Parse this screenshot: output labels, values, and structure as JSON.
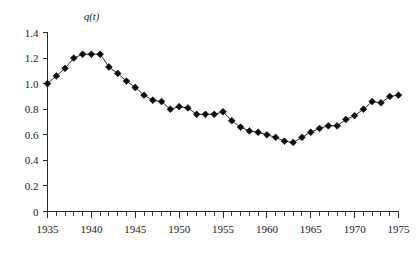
{
  "chart_data": {
    "type": "line",
    "title": "",
    "subtitle": "",
    "ylabel": "q(t)",
    "xlabel": "",
    "x": [
      1935,
      1936,
      1937,
      1938,
      1939,
      1940,
      1941,
      1942,
      1943,
      1944,
      1945,
      1946,
      1947,
      1948,
      1949,
      1950,
      1951,
      1952,
      1953,
      1954,
      1955,
      1956,
      1957,
      1958,
      1959,
      1960,
      1961,
      1962,
      1963,
      1964,
      1965,
      1966,
      1967,
      1968,
      1969,
      1970,
      1971,
      1972,
      1973,
      1974,
      1975
    ],
    "values": [
      1.0,
      1.06,
      1.12,
      1.2,
      1.23,
      1.23,
      1.23,
      1.13,
      1.08,
      1.02,
      0.97,
      0.91,
      0.87,
      0.86,
      0.8,
      0.82,
      0.81,
      0.76,
      0.76,
      0.76,
      0.78,
      0.71,
      0.66,
      0.63,
      0.62,
      0.6,
      0.58,
      0.55,
      0.54,
      0.58,
      0.62,
      0.65,
      0.67,
      0.67,
      0.72,
      0.75,
      0.8,
      0.86,
      0.85,
      0.9,
      0.91
    ],
    "series": [
      {
        "name": "q(t)",
        "marker": "diamond",
        "color": "#0d0d0d"
      }
    ],
    "xlim": [
      1935,
      1975
    ],
    "ylim": [
      0,
      1.4
    ],
    "x_major_ticks": [
      1935,
      1940,
      1945,
      1950,
      1955,
      1960,
      1965,
      1970,
      1975
    ],
    "x_major_tick_labels": [
      "1935",
      "1940",
      "1945",
      "1950",
      "1955",
      "1960",
      "1965",
      "1970",
      "1975"
    ],
    "x_minor_tick_step": 1,
    "y_major_ticks": [
      0,
      0.2,
      0.4,
      0.6,
      0.8,
      1.0,
      1.2,
      1.4
    ],
    "y_major_tick_labels": [
      "0",
      "0.2",
      "0.4",
      "0.6",
      "0.8",
      "1.0",
      "1.2",
      "1.4"
    ],
    "grid": false,
    "legend": false,
    "legend_position": "none",
    "axis_color": "#2b2b2b",
    "background": "#ffffff"
  }
}
